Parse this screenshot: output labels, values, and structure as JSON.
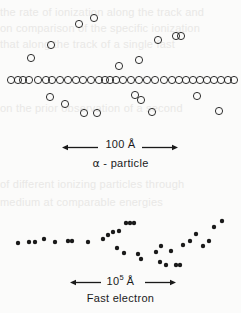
{
  "figure": {
    "background_color": "#fbfbfa",
    "ink_color": "#1a1a1a"
  },
  "bleed_text": {
    "line1": "the rate of ionization along the track and",
    "line2": "on comparison of the specific ionization",
    "line3": "that along the track of a single fast",
    "line4": "on the prior observation of a second",
    "line5": "of different ionizing particles through",
    "line6": "medium at comparable energies"
  },
  "panels": [
    {
      "name": "alpha-particle-panel",
      "particle_label": "α - particle",
      "particle_symbol": "α",
      "particle_word": "particle",
      "scale_value": "100",
      "scale_unit": "Å",
      "scale_label_plain": "100 Å",
      "scale_exponent": "",
      "marker_style": "open-circle",
      "marker_radius_px": 3.6,
      "marker_stroke_px": 0.9,
      "scale_bar": {
        "x1": 62,
        "x2": 178,
        "y": 148
      },
      "core_track": {
        "description": "dense primary ionization along a straight horizontal path",
        "y": 80,
        "x_positions": [
          11,
          18,
          23,
          29,
          38,
          46,
          52,
          60,
          68,
          76,
          83,
          91,
          99,
          105,
          110,
          116,
          123,
          131,
          139,
          147,
          155,
          164,
          172,
          179,
          186,
          193,
          200,
          207,
          214,
          221,
          228,
          234
        ]
      },
      "delta_rays": {
        "description": "secondary delta-ray electrons branching off the primary track",
        "points": [
          {
            "x": 31,
            "y": 58
          },
          {
            "x": 51,
            "y": 45
          },
          {
            "x": 79,
            "y": 24
          },
          {
            "x": 94,
            "y": 18
          },
          {
            "x": 119,
            "y": 66
          },
          {
            "x": 139,
            "y": 60
          },
          {
            "x": 158,
            "y": 40
          },
          {
            "x": 176,
            "y": 36
          },
          {
            "x": 181,
            "y": 36
          },
          {
            "x": 50,
            "y": 97
          },
          {
            "x": 65,
            "y": 104
          },
          {
            "x": 84,
            "y": 113
          },
          {
            "x": 97,
            "y": 113
          },
          {
            "x": 135,
            "y": 95
          },
          {
            "x": 141,
            "y": 100
          },
          {
            "x": 152,
            "y": 112
          },
          {
            "x": 197,
            "y": 96
          },
          {
            "x": 219,
            "y": 111
          }
        ]
      }
    },
    {
      "name": "fast-electron-panel",
      "particle_label": "Fast electron",
      "scale_value": "10",
      "scale_exponent": "5",
      "scale_unit": "Å",
      "scale_label_plain": "10^5 Å",
      "marker_style": "filled-dot",
      "marker_radius_px": 2.2,
      "scale_bar": {
        "x1": 70,
        "x2": 176,
        "y": 283
      },
      "core_track": {
        "description": "sparse widely spaced ion clusters along a meandering electron path",
        "points": [
          {
            "x": 18,
            "y": 243
          },
          {
            "x": 29,
            "y": 242
          },
          {
            "x": 35,
            "y": 242
          },
          {
            "x": 44,
            "y": 239
          },
          {
            "x": 55,
            "y": 242
          },
          {
            "x": 68,
            "y": 241
          },
          {
            "x": 72,
            "y": 241
          },
          {
            "x": 88,
            "y": 242
          },
          {
            "x": 103,
            "y": 239
          },
          {
            "x": 108,
            "y": 235
          },
          {
            "x": 113,
            "y": 232
          },
          {
            "x": 119,
            "y": 231
          },
          {
            "x": 126,
            "y": 223
          },
          {
            "x": 130,
            "y": 223
          },
          {
            "x": 134,
            "y": 223
          },
          {
            "x": 117,
            "y": 248
          },
          {
            "x": 124,
            "y": 253
          },
          {
            "x": 138,
            "y": 254
          },
          {
            "x": 141,
            "y": 259
          },
          {
            "x": 156,
            "y": 252
          },
          {
            "x": 161,
            "y": 246
          },
          {
            "x": 160,
            "y": 262
          },
          {
            "x": 166,
            "y": 265
          },
          {
            "x": 171,
            "y": 251
          },
          {
            "x": 176,
            "y": 265
          },
          {
            "x": 180,
            "y": 265
          },
          {
            "x": 183,
            "y": 245
          },
          {
            "x": 190,
            "y": 241
          },
          {
            "x": 196,
            "y": 234
          },
          {
            "x": 203,
            "y": 246
          },
          {
            "x": 209,
            "y": 241
          },
          {
            "x": 214,
            "y": 227
          },
          {
            "x": 222,
            "y": 221
          }
        ]
      }
    }
  ]
}
